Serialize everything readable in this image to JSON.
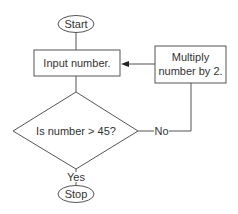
{
  "diagram": {
    "type": "flowchart",
    "nodes": {
      "start": {
        "label": "Start",
        "shape": "oval"
      },
      "input": {
        "label": "Input number.",
        "shape": "rectangle"
      },
      "multiply": {
        "line1": "Multiply",
        "line2": "number by 2.",
        "shape": "rectangle"
      },
      "decision": {
        "label": "Is number > 45?",
        "shape": "diamond"
      },
      "stop": {
        "label": "Stop",
        "shape": "oval"
      }
    },
    "edges": {
      "yes_label": "Yes",
      "no_label": "No"
    },
    "colors": {
      "stroke": "#555555",
      "text": "#333333",
      "background": "#ffffff"
    }
  }
}
